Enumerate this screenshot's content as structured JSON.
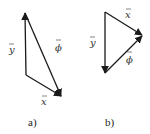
{
  "diagrams": [
    {
      "caption": "a)",
      "vectors": [
        {
          "name": "y",
          "label": "y",
          "overbar": true,
          "from": "corner",
          "to": "apex"
        },
        {
          "name": "x",
          "label": "x",
          "overbar": true,
          "from": "corner",
          "to": "tip"
        },
        {
          "name": "phi",
          "label": "ϕ",
          "overbar": true,
          "from": "apex",
          "to": "tip"
        }
      ]
    },
    {
      "caption": "b)",
      "vectors": [
        {
          "name": "x",
          "label": "x",
          "overbar": true,
          "from": "top",
          "to": "right"
        },
        {
          "name": "y",
          "label": "y",
          "overbar": true,
          "from": "top",
          "to": "bottom"
        },
        {
          "name": "phi",
          "label": "ϕ",
          "overbar": true,
          "from": "bottom",
          "to": "right"
        }
      ]
    }
  ],
  "colors": {
    "stroke": "#1a1a1a",
    "text": "#333333",
    "background": "#ffffff"
  }
}
